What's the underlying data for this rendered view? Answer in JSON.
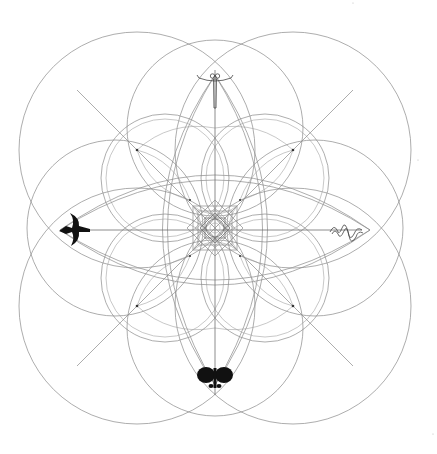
{
  "diagram": {
    "title": "",
    "center": [
      215,
      228
    ],
    "colors": {
      "background": "#ffffff",
      "line": "#8a8a8a",
      "glyph": "#111111"
    },
    "emblems": [
      {
        "position": "top",
        "name": "dragonfly",
        "xy": [
          215,
          68
        ]
      },
      {
        "position": "left",
        "name": "bird",
        "xy": [
          72,
          230
        ]
      },
      {
        "position": "right",
        "name": "serpent",
        "xy": [
          350,
          230
        ]
      },
      {
        "position": "bottom",
        "name": "butterfly",
        "xy": [
          215,
          375
        ]
      }
    ],
    "large_circles": [
      {
        "cx": 137,
        "cy": 150,
        "r": 118
      },
      {
        "cx": 293,
        "cy": 150,
        "r": 118
      },
      {
        "cx": 137,
        "cy": 306,
        "r": 118
      },
      {
        "cx": 293,
        "cy": 306,
        "r": 118
      }
    ],
    "medium_circles": [
      {
        "cx": 215,
        "cy": 120,
        "r": 82
      },
      {
        "cx": 215,
        "cy": 336,
        "r": 82
      },
      {
        "cx": 107,
        "cy": 228,
        "r": 82
      },
      {
        "cx": 323,
        "cy": 228,
        "r": 82
      }
    ],
    "nodes": [
      [
        137,
        150
      ],
      [
        293,
        150
      ],
      [
        137,
        306
      ],
      [
        293,
        306
      ],
      [
        190,
        200
      ],
      [
        240,
        200
      ],
      [
        190,
        256
      ],
      [
        240,
        256
      ]
    ]
  }
}
